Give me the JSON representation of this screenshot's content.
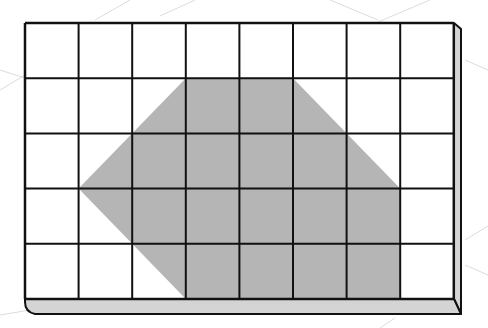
{
  "diagram": {
    "type": "grid-with-shaded-polygon",
    "grid": {
      "columns": 8,
      "rows": 5,
      "left": 25,
      "top": 23,
      "cell_width": 53.6,
      "cell_height": 55.2,
      "line_color": "#111111",
      "cell_fill": "#ffffff"
    },
    "polygon": {
      "description": "Hexagon shaded region on grid",
      "vertices_grid_units": [
        [
          3,
          1
        ],
        [
          5,
          1
        ],
        [
          7,
          3
        ],
        [
          7,
          5
        ],
        [
          3,
          5
        ],
        [
          1,
          3
        ]
      ],
      "fill": "#b5b5b5"
    },
    "frame": {
      "edge_fill": "#d4d4d4"
    }
  }
}
